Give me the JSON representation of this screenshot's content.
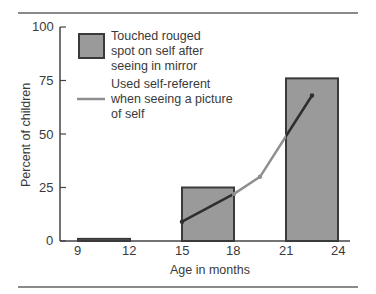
{
  "chart_data": {
    "type": "bar",
    "title": "",
    "xlabel": "Age in months",
    "ylabel": "Percent of children",
    "ylim": [
      0,
      100
    ],
    "xlim": [
      8,
      25
    ],
    "y_ticks": [
      "0",
      "25",
      "50",
      "75",
      "100"
    ],
    "x_ticks": [
      "9",
      "12",
      "15",
      "18",
      "21",
      "24"
    ],
    "grid": false,
    "legend_position": "upper-left",
    "series": [
      {
        "name": "Touched rouged spot on self after seeing in mirror",
        "type": "bar",
        "bins": [
          {
            "from": 9,
            "to": 12,
            "value": 1
          },
          {
            "from": 15,
            "to": 18,
            "value": 25
          },
          {
            "from": 21,
            "to": 24,
            "value": 76
          }
        ]
      },
      {
        "name": "Used self-referent when seeing a picture of self",
        "type": "line",
        "points": [
          {
            "x": 15,
            "y": 9
          },
          {
            "x": 18,
            "y": 22
          },
          {
            "x": 19.5,
            "y": 30
          },
          {
            "x": 22.5,
            "y": 68
          }
        ]
      }
    ]
  },
  "legend": {
    "bar_label_lines": [
      "Touched rouged",
      "spot on self after",
      "seeing in mirror"
    ],
    "line_label_lines": [
      "Used self-referent",
      "when seeing a picture",
      "of self"
    ]
  },
  "colors": {
    "bar_fill": "#9a9a9a",
    "bar_stroke": "#3a3a3a",
    "line_light": "#8f8f8f",
    "line_dark": "#2e2e2e",
    "axis": "#444444",
    "rule": "#8a8a8a"
  }
}
